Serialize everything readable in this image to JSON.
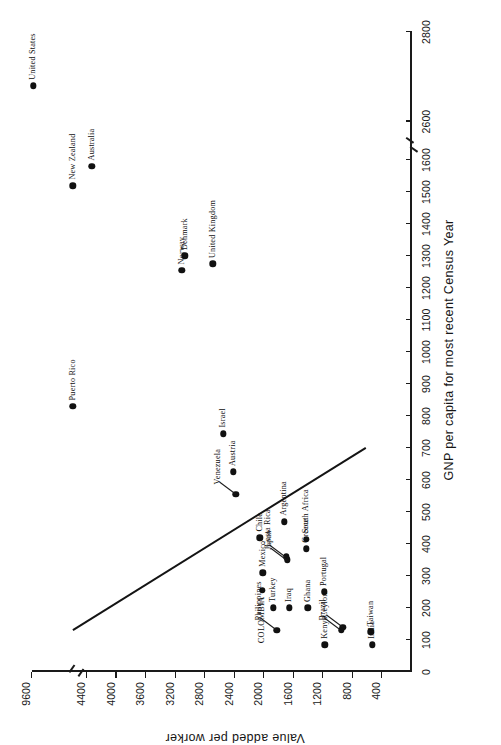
{
  "figure": {
    "artifact_text": "66",
    "orientation": "rotated-90-ccw"
  },
  "chart_data": {
    "type": "scatter",
    "title": "",
    "xlabel": "GNP per capita for most recent Census Year",
    "ylabel": "Value added per worker",
    "xlim": [
      0,
      2800
    ],
    "ylim": [
      0,
      9600
    ],
    "x_ticks": [
      0,
      100,
      200,
      300,
      400,
      500,
      600,
      700,
      800,
      900,
      1000,
      1100,
      1200,
      1300,
      1400,
      1500,
      1600,
      2600,
      2800
    ],
    "x_tick_labels": [
      "0",
      "100",
      "200",
      "300",
      "400",
      "500",
      "600",
      "700",
      "800",
      "900",
      "1000",
      "1100",
      "1200",
      "1300",
      "1400",
      "1500",
      "1600",
      "2600",
      "2800"
    ],
    "x_axis_break": [
      1600,
      2600
    ],
    "y_ticks": [
      400,
      800,
      1200,
      1600,
      2000,
      2400,
      2800,
      3200,
      3600,
      4000,
      4400,
      9600
    ],
    "y_tick_labels": [
      "400",
      "800",
      "1200",
      "1600",
      "2000",
      "2400",
      "2800",
      "3200",
      "3600",
      "4000",
      "4400",
      "9600"
    ],
    "y_axis_break": [
      4400,
      9600
    ],
    "grid": false,
    "legend": null,
    "highlight_country": "COLOMBIA",
    "trend_line": {
      "label": "fitted regression line",
      "x_start": 130,
      "y_start": 4470,
      "x_end": 700,
      "y_end": 620
    },
    "points": [
      {
        "label": "United States",
        "x": 2680,
        "y": 9430,
        "label_pos": "below"
      },
      {
        "label": "New Zealand",
        "x": 1520,
        "y": 4560,
        "label_pos": "right"
      },
      {
        "label": "Australia",
        "x": 1580,
        "y": 4340,
        "label_pos": "right"
      },
      {
        "label": "Norway",
        "x": 1255,
        "y": 3120,
        "label_pos": "right"
      },
      {
        "label": "Denmark",
        "x": 1300,
        "y": 3080,
        "label_pos": "right"
      },
      {
        "label": "United Kingdom",
        "x": 1275,
        "y": 2700,
        "label_pos": "right"
      },
      {
        "label": "Puerto Rico",
        "x": 830,
        "y": 4540,
        "label_pos": "right"
      },
      {
        "label": "Israel",
        "x": 745,
        "y": 2555,
        "label_pos": "right"
      },
      {
        "label": "Austria",
        "x": 625,
        "y": 2420,
        "label_pos": "right"
      },
      {
        "label": "Venezuela",
        "x": 555,
        "y": 2390,
        "label_pos": "leader"
      },
      {
        "label": "Chile",
        "x": 420,
        "y": 2060,
        "label_pos": "right"
      },
      {
        "label": "Argentina",
        "x": 470,
        "y": 1730,
        "label_pos": "right"
      },
      {
        "label": "Costa Rica",
        "x": 360,
        "y": 1700,
        "label_pos": "leader"
      },
      {
        "label": "Greece",
        "x": 385,
        "y": 1430,
        "label_pos": "right"
      },
      {
        "label": "South Africa",
        "x": 415,
        "y": 1430,
        "label_pos": "right"
      },
      {
        "label": "COLOMBIA",
        "x": 255,
        "y": 2025,
        "label_pos": "left"
      },
      {
        "label": "Mexico",
        "x": 310,
        "y": 2020,
        "label_pos": "right"
      },
      {
        "label": "Japan",
        "x": 350,
        "y": 1690,
        "label_pos": "leader"
      },
      {
        "label": "Portugal",
        "x": 250,
        "y": 1190,
        "label_pos": "right"
      },
      {
        "label": "Turkey",
        "x": 200,
        "y": 1880,
        "label_pos": "right"
      },
      {
        "label": "Iraq",
        "x": 200,
        "y": 1660,
        "label_pos": "right"
      },
      {
        "label": "Philippines",
        "x": 130,
        "y": 1830,
        "label_pos": "leader"
      },
      {
        "label": "Ghana",
        "x": 200,
        "y": 1410,
        "label_pos": "right"
      },
      {
        "label": "Kenya",
        "x": 85,
        "y": 1180,
        "label_pos": "right"
      },
      {
        "label": "Brazil",
        "x": 130,
        "y": 955,
        "label_pos": "leader"
      },
      {
        "label": "Ceylon",
        "x": 140,
        "y": 935,
        "label_pos": "leader"
      },
      {
        "label": "Taiwan",
        "x": 125,
        "y": 560,
        "label_pos": "right"
      },
      {
        "label": "India",
        "x": 85,
        "y": 540,
        "label_pos": "right"
      }
    ]
  }
}
